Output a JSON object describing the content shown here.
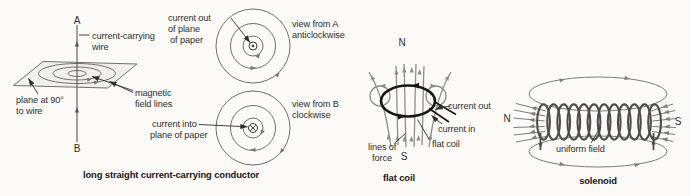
{
  "colors": {
    "background": "#fbfaf6",
    "ink": "#2e2e2e",
    "structure_line": "#6f6f6f",
    "field_line_gray": "#8d8d8d",
    "coil_black": "#161616"
  },
  "straight_conductor": {
    "caption": "long straight current-carrying conductor",
    "point_a": "A",
    "point_b": "B",
    "wire_l1": "current-carrying",
    "wire_l2": "wire",
    "plane_l1": "plane at 90°",
    "plane_l2": "to wire",
    "field_l1": "magnetic",
    "field_l2": "field lines"
  },
  "view_a": {
    "out_l1": "current out",
    "out_l2": "of plane",
    "out_l3": "of paper",
    "label_l1": "view from A",
    "label_l2": "anticlockwise"
  },
  "view_b": {
    "into_l1": "current into",
    "into_l2": "plane of paper",
    "label_l1": "view from B",
    "label_l2": "clockwise"
  },
  "flat_coil": {
    "caption": "flat coil",
    "north": "N",
    "south": "S",
    "current_out": "current out",
    "current_in": "current in",
    "coil_label": "flat coil",
    "force_l1": "lines of",
    "force_l2": "force"
  },
  "solenoid": {
    "caption": "solenoid",
    "north": "N",
    "south": "S",
    "field_label": "uniform field"
  }
}
